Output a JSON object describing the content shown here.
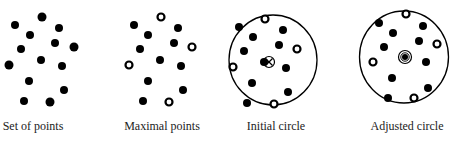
{
  "panels": [
    {
      "caption": "Set of points",
      "caption_x": 33
    },
    {
      "caption": "Maximal points",
      "caption_x": 162
    },
    {
      "caption": "Initial circle",
      "caption_x": 276
    },
    {
      "caption": "Adjusted circle",
      "caption_x": 407
    }
  ],
  "colors": {
    "ink": "#000000",
    "background": "#ffffff"
  }
}
